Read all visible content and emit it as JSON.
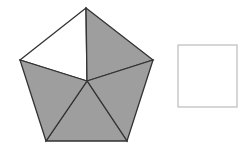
{
  "figure": {
    "pentagon": {
      "vertices": [
        [
          86,
          8
        ],
        [
          153,
          60
        ],
        [
          127,
          141
        ],
        [
          46,
          141
        ],
        [
          20,
          60
        ]
      ],
      "center": [
        87,
        81
      ],
      "shaded_sectors": 4,
      "unshaded_sectors": 1,
      "total_sectors": 5
    },
    "square": {
      "x": 178,
      "y": 45,
      "w": 59,
      "h": 62
    },
    "colors": {
      "shade": "#9e9e9e",
      "stroke": "#333333",
      "square_stroke": "#bbbbbb",
      "background": "#ffffff"
    }
  }
}
